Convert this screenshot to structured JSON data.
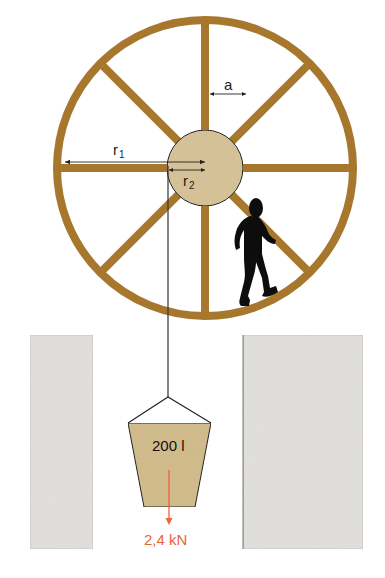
{
  "diagram": {
    "type": "treadwheel-crane",
    "labels": {
      "spoke_gap": "a",
      "outer_radius": "r",
      "outer_radius_sub": "1",
      "hub_radius": "r",
      "hub_radius_sub": "2",
      "bucket_volume": "200 l",
      "load_force": "2,4 kN"
    },
    "colors": {
      "wood": "#A8772E",
      "hub_fill": "#D9C59B",
      "bucket_fill": "#D4BE8E",
      "wall_fill": "#E4E2DE",
      "force_arrow": "#E8643A",
      "line": "#333333",
      "person": "#0d0d0d"
    },
    "geometry": {
      "wheel_center": [
        205,
        168
      ],
      "wheel_outer_radius": 148,
      "hub_radius": 38,
      "spokes": 8
    }
  }
}
